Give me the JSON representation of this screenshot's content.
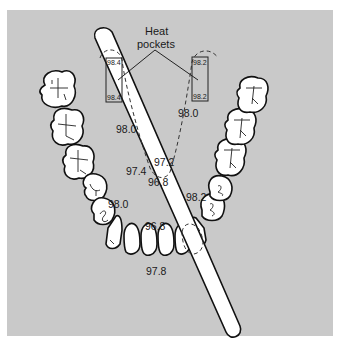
{
  "diagram": {
    "heat_pockets_label": [
      "Heat",
      "pockets"
    ],
    "background_color": "#c9c9c9",
    "left_pocket": {
      "top": "98.4",
      "bottom": "98.4"
    },
    "right_pocket": {
      "top": "98.2",
      "bottom": "98.2"
    },
    "temperatures": {
      "left_cheek_upper": "98.0",
      "right_cheek_upper": "98.0",
      "tongue_center_right": "97.2",
      "tongue_center_left": "97.4",
      "tongue_center_bottom": "96.8",
      "right_mid": "98.2",
      "left_mid": "98.0",
      "front_inner": "96.8",
      "front_outer": "97.8"
    },
    "elements": {
      "thermometer": "thermometer-probe",
      "teeth": "lower-dental-arch"
    }
  }
}
